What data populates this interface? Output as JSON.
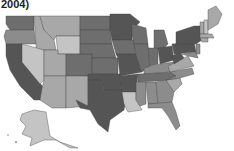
{
  "title": {
    "text": "2004)"
  },
  "map": {
    "type": "choropleth",
    "region": "United States",
    "shading": "grayscale",
    "colors": {
      "darkest": "#555555",
      "dark": "#6e6e6e",
      "medium": "#8c8c8c",
      "light": "#a8a8a8",
      "lightest": "#c4c4c4",
      "border": "#444444"
    },
    "legend_visible": false
  }
}
